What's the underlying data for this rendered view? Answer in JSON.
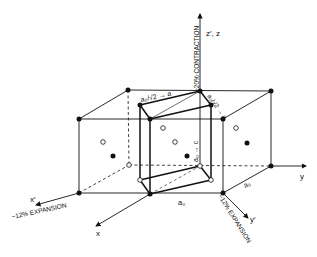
{
  "diagram": {
    "type": "crystal lattice distortion (Bain correspondence)",
    "axes": {
      "z_label": "z′, z",
      "y_label": "y",
      "x_label": "x",
      "x_prime_label": "x′",
      "y_prime_label": "y′"
    },
    "annotations": {
      "contraction": "~20% CONTRACTION",
      "expansion_x": "~12% EXPANSION",
      "expansion_y": "~12% EXPANSION",
      "edge_a_sqrt2_left": "a₀/√2 → a",
      "edge_a_sqrt2_right": "a₀/√2 → a",
      "edge_c": "a₀ → c",
      "edge_a0_bottom": "a₀",
      "edge_a0_right": "a₀"
    },
    "legend": {
      "filled_circle": "filled atom site",
      "open_circle": "open atom site"
    }
  }
}
